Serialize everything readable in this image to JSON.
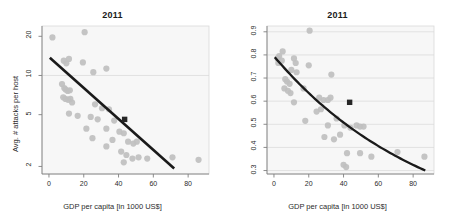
{
  "figure": {
    "width": 450,
    "height": 219,
    "background": "#ffffff",
    "point_color": "#bfbfbf",
    "highlight_color": "#262626",
    "fit_line_color": "#1a1a1a",
    "grid_color": "#d9d9d9",
    "axis_color": "#808080",
    "panel_background": "#f7f7f7"
  },
  "chart_data": [
    {
      "type": "scatter",
      "panel": "left",
      "title": "2011",
      "xlabel": "GDP per capita [in 1000 US$]",
      "ylabel": "Avg. # attacks per host",
      "xlim": [
        -4,
        92
      ],
      "ylim": [
        1.75,
        24
      ],
      "yscale": "log",
      "xscale": "linear",
      "xticks": [
        0,
        20,
        40,
        60,
        80
      ],
      "xticklabels": [
        "0",
        "20",
        "40",
        "60",
        "80"
      ],
      "yticks": [
        2,
        5,
        10,
        20
      ],
      "yticklabels": [
        "2",
        "5",
        "10",
        "20"
      ],
      "grid": "horizontal-at-10-only",
      "gridlines_y": [
        10
      ],
      "legend": "none",
      "points": [
        {
          "x": 2.0,
          "y": 19.6
        },
        {
          "x": 20.5,
          "y": 21.5
        },
        {
          "x": 8.5,
          "y": 13.0
        },
        {
          "x": 11.5,
          "y": 13.4
        },
        {
          "x": 10.0,
          "y": 12.4
        },
        {
          "x": 19.5,
          "y": 12.6
        },
        {
          "x": 33.0,
          "y": 11.3
        },
        {
          "x": 25.5,
          "y": 10.6
        },
        {
          "x": 7.5,
          "y": 8.6
        },
        {
          "x": 8.8,
          "y": 8.0
        },
        {
          "x": 9.6,
          "y": 7.8
        },
        {
          "x": 10.8,
          "y": 7.6
        },
        {
          "x": 12.0,
          "y": 7.7
        },
        {
          "x": 8.2,
          "y": 6.8
        },
        {
          "x": 9.5,
          "y": 6.6
        },
        {
          "x": 11.0,
          "y": 6.5
        },
        {
          "x": 12.3,
          "y": 6.6
        },
        {
          "x": 13.3,
          "y": 6.2
        },
        {
          "x": 26.5,
          "y": 6.0
        },
        {
          "x": 30.5,
          "y": 5.6
        },
        {
          "x": 34.5,
          "y": 5.5
        },
        {
          "x": 11.5,
          "y": 5.1
        },
        {
          "x": 16.5,
          "y": 4.9
        },
        {
          "x": 24.0,
          "y": 4.8
        },
        {
          "x": 28.0,
          "y": 4.6
        },
        {
          "x": 37.5,
          "y": 4.5
        },
        {
          "x": 21.5,
          "y": 3.9
        },
        {
          "x": 33.0,
          "y": 3.9
        },
        {
          "x": 40.5,
          "y": 3.7
        },
        {
          "x": 43.0,
          "y": 3.6
        },
        {
          "x": 25.0,
          "y": 3.3
        },
        {
          "x": 36.5,
          "y": 3.2
        },
        {
          "x": 45.5,
          "y": 3.1
        },
        {
          "x": 48.5,
          "y": 3.0
        },
        {
          "x": 50.5,
          "y": 3.1
        },
        {
          "x": 33.0,
          "y": 2.85
        },
        {
          "x": 41.5,
          "y": 2.6
        },
        {
          "x": 44.5,
          "y": 2.45
        },
        {
          "x": 48.0,
          "y": 2.3
        },
        {
          "x": 51.5,
          "y": 2.35
        },
        {
          "x": 56.5,
          "y": 2.3
        },
        {
          "x": 43.0,
          "y": 2.15
        },
        {
          "x": 71.0,
          "y": 2.35
        },
        {
          "x": 86.0,
          "y": 2.25
        }
      ],
      "highlight_point": {
        "x": 43.5,
        "y": 4.6,
        "marker": "square",
        "color": "#262626"
      },
      "fit_line": {
        "x_start": 0.5,
        "y_start": 13.7,
        "x_end": 72.0,
        "y_end": 1.93,
        "type": "linear-on-log-y"
      }
    },
    {
      "type": "scatter",
      "panel": "right",
      "title": "2011",
      "xlabel": "GDP per capita [in 1000 US$]",
      "ylabel": "% attacked hosts",
      "xlim": [
        -4,
        92
      ],
      "ylim": [
        0.285,
        0.925
      ],
      "yscale": "linear",
      "xscale": "linear",
      "xticks": [
        0,
        20,
        40,
        60,
        80
      ],
      "xticklabels": [
        "0",
        "20",
        "40",
        "60",
        "80"
      ],
      "yticks": [
        0.3,
        0.4,
        0.5,
        0.6,
        0.7,
        0.8,
        0.9
      ],
      "yticklabels": [
        "0.3",
        "0.4",
        "0.5",
        "0.6",
        "0.7",
        "0.8",
        "0.9"
      ],
      "grid": "horizontal",
      "gridlines_y": [
        0.3,
        0.4,
        0.5,
        0.6,
        0.7,
        0.8,
        0.9
      ],
      "legend": "none",
      "points": [
        {
          "x": 20.5,
          "y": 0.905
        },
        {
          "x": 5.0,
          "y": 0.815
        },
        {
          "x": 2.0,
          "y": 0.785
        },
        {
          "x": 3.0,
          "y": 0.795
        },
        {
          "x": 2.5,
          "y": 0.765
        },
        {
          "x": 4.5,
          "y": 0.775
        },
        {
          "x": 11.5,
          "y": 0.785
        },
        {
          "x": 12.5,
          "y": 0.765
        },
        {
          "x": 20.0,
          "y": 0.755
        },
        {
          "x": 10.0,
          "y": 0.735
        },
        {
          "x": 13.0,
          "y": 0.725
        },
        {
          "x": 33.0,
          "y": 0.715
        },
        {
          "x": 6.5,
          "y": 0.695
        },
        {
          "x": 7.5,
          "y": 0.685
        },
        {
          "x": 9.0,
          "y": 0.675
        },
        {
          "x": 6.0,
          "y": 0.655
        },
        {
          "x": 8.0,
          "y": 0.645
        },
        {
          "x": 9.5,
          "y": 0.635
        },
        {
          "x": 17.0,
          "y": 0.655
        },
        {
          "x": 11.5,
          "y": 0.595
        },
        {
          "x": 26.0,
          "y": 0.615
        },
        {
          "x": 28.5,
          "y": 0.605
        },
        {
          "x": 31.0,
          "y": 0.605
        },
        {
          "x": 32.5,
          "y": 0.615
        },
        {
          "x": 27.0,
          "y": 0.565
        },
        {
          "x": 24.5,
          "y": 0.555
        },
        {
          "x": 18.0,
          "y": 0.515
        },
        {
          "x": 36.0,
          "y": 0.525
        },
        {
          "x": 31.0,
          "y": 0.495
        },
        {
          "x": 40.5,
          "y": 0.495
        },
        {
          "x": 44.0,
          "y": 0.485
        },
        {
          "x": 47.5,
          "y": 0.495
        },
        {
          "x": 49.5,
          "y": 0.49
        },
        {
          "x": 51.5,
          "y": 0.49
        },
        {
          "x": 38.0,
          "y": 0.455
        },
        {
          "x": 29.0,
          "y": 0.445
        },
        {
          "x": 34.5,
          "y": 0.435
        },
        {
          "x": 42.0,
          "y": 0.375
        },
        {
          "x": 49.5,
          "y": 0.375
        },
        {
          "x": 56.0,
          "y": 0.36
        },
        {
          "x": 40.0,
          "y": 0.325
        },
        {
          "x": 41.5,
          "y": 0.315
        },
        {
          "x": 71.0,
          "y": 0.38
        },
        {
          "x": 86.5,
          "y": 0.36
        }
      ],
      "highlight_point": {
        "x": 43.5,
        "y": 0.595,
        "marker": "square",
        "color": "#262626"
      },
      "fit_line": {
        "type": "exponential-decay",
        "x_start": 0.5,
        "y_start": 0.79,
        "x_end": 87.0,
        "y_end": 0.3
      }
    }
  ],
  "panels": [
    {
      "name": "left-panel",
      "title": "2011",
      "xlabel": "GDP per capita [in 1000 US$]",
      "ylabel": "Avg. # attacks per host",
      "xticklabels": [
        "0",
        "20",
        "40",
        "60",
        "80"
      ],
      "yticklabels": [
        "2",
        "5",
        "10",
        "20"
      ]
    },
    {
      "name": "right-panel",
      "title": "2011",
      "xlabel": "GDP per capita [in 1000 US$]",
      "ylabel": "% attacked hosts",
      "xticklabels": [
        "0",
        "20",
        "40",
        "60",
        "80"
      ],
      "yticklabels": [
        "0.3",
        "0.4",
        "0.5",
        "0.6",
        "0.7",
        "0.8",
        "0.9"
      ]
    }
  ]
}
